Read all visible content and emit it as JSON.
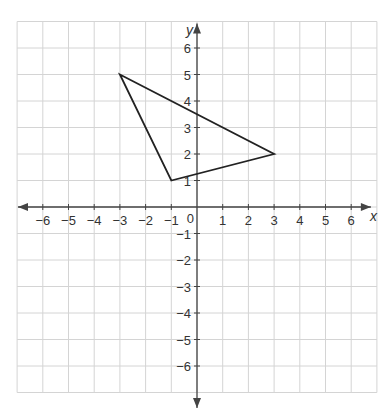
{
  "header": {
    "instruction_text": ""
  },
  "axes": {
    "x_label": "x",
    "y_label": "y",
    "origin_label": "0",
    "x_ticks": [
      -6,
      -5,
      -4,
      -3,
      -2,
      -1,
      1,
      2,
      3,
      4,
      5,
      6
    ],
    "y_ticks": [
      -6,
      -5,
      -4,
      -3,
      -2,
      -1,
      1,
      2,
      3,
      4,
      5,
      6
    ],
    "x_range": [
      -7,
      7
    ],
    "y_range": [
      -7,
      7
    ]
  },
  "shapes": [
    {
      "type": "triangle",
      "vertices": [
        [
          -3,
          5
        ],
        [
          3,
          2
        ],
        [
          -1,
          1
        ]
      ],
      "stroke": "#222222"
    }
  ],
  "colors": {
    "grid": "#d4d4d4",
    "axis": "#444444",
    "shape": "#222222"
  }
}
